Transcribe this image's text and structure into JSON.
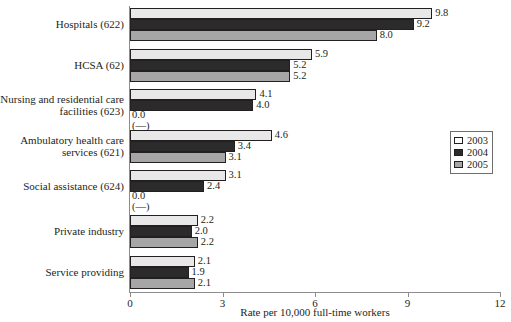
{
  "chart_data": {
    "type": "bar",
    "orientation": "horizontal",
    "title": "",
    "xlabel": "Rate per 10,000 full-time workers",
    "ylabel": "",
    "xlim": [
      0,
      12
    ],
    "xticks": [
      "0",
      "3",
      "6",
      "9",
      "12"
    ],
    "grid": false,
    "legend_position": "right",
    "categories": [
      "Hospitals (622)",
      "HCSA (62)",
      "Nursing and residential care facilities (623)",
      "Ambulatory health care services (621)",
      "Social assistance (624)",
      "Private industry",
      "Service providing"
    ],
    "series": [
      {
        "name": "2003",
        "color": "#e8e8e8",
        "values": [
          9.8,
          5.9,
          4.1,
          4.6,
          3.1,
          2.2,
          2.1
        ]
      },
      {
        "name": "2004",
        "color": "#2b2b2b",
        "values": [
          9.2,
          5.2,
          4.0,
          3.4,
          2.4,
          2.0,
          1.9
        ]
      },
      {
        "name": "2005",
        "color": "#a6a6a6",
        "values": [
          8.0,
          5.2,
          0.0,
          3.1,
          0.0,
          2.2,
          2.1
        ]
      }
    ],
    "value_labels": [
      [
        "9.8",
        "9.2",
        "8.0"
      ],
      [
        "5.9",
        "5.2",
        "5.2"
      ],
      [
        "4.1",
        "4.0",
        "0.0"
      ],
      [
        "4.6",
        "3.4",
        "3.1"
      ],
      [
        "3.1",
        "2.4",
        "0.0"
      ],
      [
        "2.2",
        "2.0",
        "2.2"
      ],
      [
        "2.1",
        "1.9",
        "2.1"
      ]
    ],
    "suppressed_marker": "(—)",
    "suppressed_cells": [
      [
        2,
        2
      ],
      [
        4,
        2
      ]
    ]
  },
  "axis": {
    "x_title": "Rate per 10,000 full-time workers",
    "ticks": [
      {
        "label": "0",
        "value": 0
      },
      {
        "label": "3",
        "value": 3
      },
      {
        "label": "6",
        "value": 6
      },
      {
        "label": "9",
        "value": 9
      },
      {
        "label": "12",
        "value": 12
      }
    ]
  },
  "legend": {
    "items": [
      {
        "label": "2003",
        "swatch": "light-gray"
      },
      {
        "label": "2004",
        "swatch": "dark-gray"
      },
      {
        "label": "2005",
        "swatch": "medium-gray"
      }
    ]
  },
  "groups": [
    {
      "label_lines": [
        "Hospitals (622)"
      ],
      "bars": [
        {
          "series": "2003",
          "value": 9.8,
          "label": "9.8"
        },
        {
          "series": "2004",
          "value": 9.2,
          "label": "9.2"
        },
        {
          "series": "2005",
          "value": 8.0,
          "label": "8.0"
        }
      ]
    },
    {
      "label_lines": [
        "HCSA (62)"
      ],
      "bars": [
        {
          "series": "2003",
          "value": 5.9,
          "label": "5.9"
        },
        {
          "series": "2004",
          "value": 5.2,
          "label": "5.2"
        },
        {
          "series": "2005",
          "value": 5.2,
          "label": "5.2"
        }
      ]
    },
    {
      "label_lines": [
        "Nursing and residential care",
        "facilities (623)"
      ],
      "bars": [
        {
          "series": "2003",
          "value": 4.1,
          "label": "4.1"
        },
        {
          "series": "2004",
          "value": 4.0,
          "label": "4.0"
        },
        {
          "series": "2005",
          "value": 0.0,
          "label": "0.0",
          "sublabel": "(—)"
        }
      ]
    },
    {
      "label_lines": [
        "Ambulatory health care",
        "services (621)"
      ],
      "bars": [
        {
          "series": "2003",
          "value": 4.6,
          "label": "4.6"
        },
        {
          "series": "2004",
          "value": 3.4,
          "label": "3.4"
        },
        {
          "series": "2005",
          "value": 3.1,
          "label": "3.1"
        }
      ]
    },
    {
      "label_lines": [
        "Social assistance (624)"
      ],
      "bars": [
        {
          "series": "2003",
          "value": 3.1,
          "label": "3.1"
        },
        {
          "series": "2004",
          "value": 2.4,
          "label": "2.4"
        },
        {
          "series": "2005",
          "value": 0.0,
          "label": "0.0",
          "sublabel": "(—)"
        }
      ]
    },
    {
      "label_lines": [
        "Private industry"
      ],
      "bars": [
        {
          "series": "2003",
          "value": 2.2,
          "label": "2.2"
        },
        {
          "series": "2004",
          "value": 2.0,
          "label": "2.0"
        },
        {
          "series": "2005",
          "value": 2.2,
          "label": "2.2"
        }
      ]
    },
    {
      "label_lines": [
        "Service providing"
      ],
      "bars": [
        {
          "series": "2003",
          "value": 2.1,
          "label": "2.1"
        },
        {
          "series": "2004",
          "value": 1.9,
          "label": "1.9"
        },
        {
          "series": "2005",
          "value": 2.1,
          "label": "2.1"
        }
      ]
    }
  ]
}
